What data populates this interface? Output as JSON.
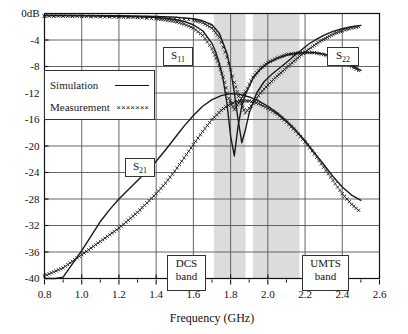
{
  "chart_data": {
    "type": "line",
    "title": "",
    "xlabel": "Frequency (GHz)",
    "ylabel": "",
    "y_unit_label": "0dB",
    "xlim": [
      0.8,
      2.6
    ],
    "ylim": [
      -40,
      0
    ],
    "xticks": [
      "0.8",
      "1.0",
      "1.2",
      "1.4",
      "1.6",
      "1.8",
      "2.0",
      "2.2",
      "2.4",
      "2.6"
    ],
    "xtick_values": [
      0.8,
      1.0,
      1.2,
      1.4,
      1.6,
      1.8,
      2.0,
      2.2,
      2.4,
      2.6
    ],
    "yticks": [
      "0dB",
      "-4",
      "-8",
      "-12",
      "-16",
      "-20",
      "-24",
      "-28",
      "-32",
      "-36",
      "-40"
    ],
    "ytick_values": [
      0,
      -4,
      -8,
      -12,
      -16,
      -20,
      -24,
      -28,
      -32,
      -36,
      -40
    ],
    "grid": true,
    "legend_position": "upper-left-inside",
    "legend": [
      {
        "name": "Simulation",
        "style": "solid-line"
      },
      {
        "name": "Measurement",
        "style": "x-markers"
      }
    ],
    "annotations": [
      {
        "text": "S11",
        "label": "S",
        "sub": "11",
        "x": 1.72,
        "y": -5.0
      },
      {
        "text": "S22",
        "label": "S",
        "sub": "22",
        "x": 2.34,
        "y": -5.0
      },
      {
        "text": "S21",
        "label": "S",
        "sub": "21",
        "x": 1.42,
        "y": -21.5
      },
      {
        "text": "DCS band",
        "line1": "DCS",
        "line2": "band",
        "x": 1.6,
        "y": -36.5
      },
      {
        "text": "UMTS band",
        "line1": "UMTS",
        "line2": "band",
        "x": 2.3,
        "y": -36.5
      }
    ],
    "shaded_bands": [
      {
        "name": "DCS band",
        "x_start": 1.71,
        "x_end": 1.88
      },
      {
        "name": "UMTS band",
        "x_start": 1.92,
        "x_end": 2.17
      }
    ],
    "series": [
      {
        "name": "S11 Simulation",
        "style": "solid",
        "x": [
          0.8,
          0.9,
          1.0,
          1.1,
          1.2,
          1.3,
          1.4,
          1.45,
          1.5,
          1.55,
          1.6,
          1.65,
          1.7,
          1.72,
          1.74,
          1.76,
          1.78,
          1.8,
          1.82,
          1.84,
          1.86,
          1.88,
          1.92,
          1.96,
          2.0,
          2.05,
          2.1,
          2.15,
          2.2,
          2.25,
          2.3,
          2.35,
          2.4,
          2.45,
          2.5
        ],
        "y": [
          -0.3,
          -0.3,
          -0.35,
          -0.4,
          -0.45,
          -0.5,
          -0.6,
          -0.7,
          -0.9,
          -1.2,
          -1.7,
          -2.6,
          -4.5,
          -5.8,
          -7.6,
          -10.0,
          -13.5,
          -18.5,
          -21.5,
          -17.0,
          -14.0,
          -12.2,
          -9.8,
          -8.4,
          -7.5,
          -6.8,
          -6.3,
          -6.0,
          -5.9,
          -5.9,
          -6.1,
          -6.5,
          -7.0,
          -7.8,
          -8.6
        ]
      },
      {
        "name": "S11 Measurement",
        "style": "markers",
        "x": [
          0.8,
          0.9,
          1.0,
          1.1,
          1.2,
          1.3,
          1.4,
          1.45,
          1.5,
          1.55,
          1.6,
          1.65,
          1.7,
          1.73,
          1.76,
          1.79,
          1.82,
          1.85,
          1.88,
          1.92,
          1.96,
          2.0,
          2.05,
          2.1,
          2.15,
          2.2,
          2.25,
          2.3,
          2.35,
          2.4,
          2.45,
          2.5
        ],
        "y": [
          -0.4,
          -0.4,
          -0.45,
          -0.5,
          -0.55,
          -0.6,
          -0.8,
          -0.95,
          -1.2,
          -1.6,
          -2.2,
          -3.3,
          -5.3,
          -7.2,
          -9.6,
          -12.8,
          -14.5,
          -13.2,
          -11.8,
          -9.6,
          -8.3,
          -7.4,
          -6.7,
          -6.2,
          -6.0,
          -5.9,
          -5.9,
          -6.2,
          -6.6,
          -7.2,
          -8.0,
          -8.8
        ]
      },
      {
        "name": "S22 Simulation",
        "style": "solid",
        "x": [
          0.8,
          1.0,
          1.2,
          1.4,
          1.5,
          1.6,
          1.65,
          1.7,
          1.74,
          1.78,
          1.8,
          1.82,
          1.84,
          1.86,
          1.88,
          1.9,
          1.94,
          1.98,
          2.02,
          2.06,
          2.1,
          2.14,
          2.18,
          2.22,
          2.26,
          2.3,
          2.35,
          2.4,
          2.45,
          2.5
        ],
        "y": [
          -0.3,
          -0.3,
          -0.35,
          -0.45,
          -0.55,
          -0.8,
          -1.1,
          -1.7,
          -3.0,
          -6.0,
          -8.5,
          -12.0,
          -16.0,
          -19.5,
          -17.5,
          -15.0,
          -12.0,
          -10.3,
          -9.2,
          -8.3,
          -7.4,
          -6.4,
          -5.5,
          -4.6,
          -3.9,
          -3.3,
          -2.7,
          -2.3,
          -2.0,
          -1.8
        ]
      },
      {
        "name": "S22 Measurement",
        "style": "markers",
        "x": [
          0.8,
          1.0,
          1.2,
          1.4,
          1.5,
          1.6,
          1.65,
          1.7,
          1.74,
          1.78,
          1.82,
          1.85,
          1.88,
          1.92,
          1.96,
          2.0,
          2.04,
          2.08,
          2.12,
          2.16,
          2.2,
          2.24,
          2.28,
          2.32,
          2.36,
          2.4,
          2.45,
          2.5
        ],
        "y": [
          -0.4,
          -0.4,
          -0.45,
          -0.6,
          -0.7,
          -1.0,
          -1.4,
          -2.2,
          -3.6,
          -6.6,
          -10.4,
          -13.2,
          -15.0,
          -13.6,
          -12.0,
          -10.8,
          -9.7,
          -8.7,
          -7.7,
          -6.7,
          -5.8,
          -5.0,
          -4.2,
          -3.6,
          -3.0,
          -2.6,
          -2.2,
          -1.9
        ]
      },
      {
        "name": "S21 Simulation",
        "style": "solid",
        "x": [
          0.8,
          0.86,
          0.9,
          0.95,
          1.0,
          1.05,
          1.1,
          1.15,
          1.2,
          1.25,
          1.3,
          1.35,
          1.4,
          1.45,
          1.5,
          1.55,
          1.6,
          1.65,
          1.7,
          1.75,
          1.8,
          1.85,
          1.9,
          1.95,
          2.0,
          2.05,
          2.1,
          2.15,
          2.2,
          2.25,
          2.3,
          2.35,
          2.4,
          2.45,
          2.5
        ],
        "y": [
          -40.0,
          -40.0,
          -39.8,
          -37.8,
          -35.8,
          -33.6,
          -31.4,
          -29.6,
          -28.0,
          -26.6,
          -25.2,
          -23.8,
          -22.3,
          -20.6,
          -18.8,
          -17.0,
          -15.4,
          -14.0,
          -13.0,
          -12.4,
          -12.1,
          -12.2,
          -12.6,
          -13.2,
          -14.0,
          -15.0,
          -16.2,
          -17.6,
          -19.2,
          -21.0,
          -22.8,
          -24.6,
          -26.2,
          -27.4,
          -28.2
        ]
      },
      {
        "name": "S21 Measurement",
        "style": "markers",
        "x": [
          0.8,
          0.85,
          0.9,
          0.95,
          1.0,
          1.05,
          1.1,
          1.15,
          1.2,
          1.25,
          1.3,
          1.35,
          1.4,
          1.45,
          1.5,
          1.55,
          1.6,
          1.65,
          1.7,
          1.75,
          1.8,
          1.85,
          1.9,
          1.95,
          2.0,
          2.05,
          2.1,
          2.15,
          2.2,
          2.25,
          2.3,
          2.35,
          2.4,
          2.45,
          2.5
        ],
        "y": [
          -39.6,
          -39.0,
          -38.4,
          -37.4,
          -36.4,
          -35.4,
          -34.4,
          -33.4,
          -32.4,
          -31.2,
          -30.0,
          -28.6,
          -27.2,
          -25.6,
          -23.8,
          -21.8,
          -19.8,
          -17.8,
          -16.0,
          -14.6,
          -13.6,
          -13.2,
          -13.2,
          -13.6,
          -14.3,
          -15.2,
          -16.4,
          -17.8,
          -19.4,
          -21.2,
          -23.2,
          -25.2,
          -27.2,
          -28.8,
          -30.0
        ]
      }
    ]
  },
  "axis": {
    "x_title": "Frequency (GHz)"
  },
  "labels": {
    "s11": "S",
    "s11_sub": "11",
    "s22": "S",
    "s22_sub": "22",
    "s21": "S",
    "s21_sub": "21",
    "dcs_line1": "DCS",
    "dcs_line2": "band",
    "umts_line1": "UMTS",
    "umts_line2": "band"
  },
  "legend": {
    "simulation_label": "Simulation",
    "measurement_label": "Measurement",
    "measurement_marks": "×××××××"
  },
  "colors": {
    "curve": "#1a1a1a",
    "grid": "#555555",
    "frame": "#111111",
    "band_shade": "#dcdcdc",
    "background": "#ffffff"
  }
}
